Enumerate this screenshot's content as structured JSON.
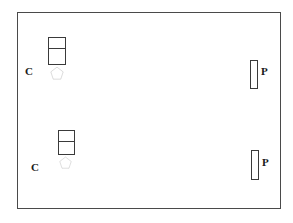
{
  "diagram": {
    "background_color": "#ffffff",
    "line_color": "#3a3a3a",
    "frame_color": "#4a4a4a",
    "text_color": "#1a1a1a",
    "frame": {
      "name": "room-boundary",
      "x": 17,
      "y": 12,
      "width": 264,
      "height": 197
    },
    "groups": [
      {
        "id": "group-top-left",
        "label": "C",
        "label_x": 25,
        "label_y": 66,
        "box": {
          "x": 48,
          "y": 37,
          "width": 18,
          "height": 28,
          "divider_offset": 10
        },
        "marker": {
          "x": 50,
          "y": 66,
          "width": 14,
          "height": 14
        }
      },
      {
        "id": "group-bottom-left",
        "label": "C",
        "label_x": 31,
        "label_y": 162,
        "box": {
          "x": 58,
          "y": 130,
          "width": 17,
          "height": 25,
          "divider_offset": 10
        },
        "marker": {
          "x": 59,
          "y": 156,
          "width": 13,
          "height": 13
        }
      }
    ],
    "bars": [
      {
        "id": "bar-top-right",
        "label": "P",
        "x": 250,
        "y": 60,
        "width": 8,
        "height": 29,
        "label_x": 261,
        "label_y": 66
      },
      {
        "id": "bar-bottom-right",
        "label": "P",
        "x": 251,
        "y": 150,
        "width": 8,
        "height": 30,
        "label_x": 262,
        "label_y": 157
      }
    ],
    "marker_polygon_points": "50,18 12,48 30,93 72,93 89,48"
  }
}
